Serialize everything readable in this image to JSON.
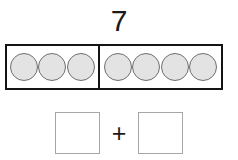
{
  "worksheet": {
    "total_label": "7",
    "bar": {
      "left_part": {
        "dot_count": 3,
        "dots": [
          "counter-dot",
          "counter-dot",
          "counter-dot"
        ]
      },
      "right_part": {
        "dot_count": 4,
        "dots": [
          "counter-dot",
          "counter-dot",
          "counter-dot",
          "counter-dot"
        ]
      }
    },
    "equation": {
      "left_box_value": "",
      "operator": "+",
      "right_box_value": ""
    },
    "colors": {
      "bar_border": "#141414",
      "dot_fill": "#e3e3e3",
      "dot_stroke": "#6e6e6e",
      "answer_box_border": "#a6a6a6",
      "text": "#1a1a1a",
      "background": "#ffffff"
    }
  }
}
